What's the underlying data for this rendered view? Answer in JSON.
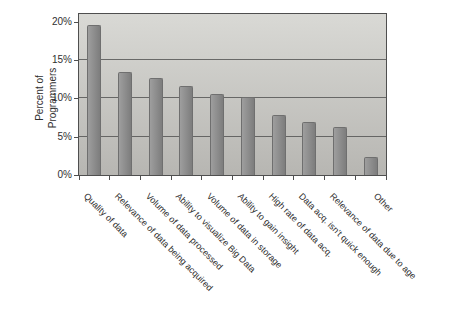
{
  "chart_data": {
    "type": "bar",
    "title": "",
    "ylabel_lines": [
      "Percent of",
      "Programmers"
    ],
    "categories": [
      "Quality of data",
      "Relevance of data being acquired",
      "Volume of data processed",
      "Ability to visualize Big Data",
      "Volume of data in storage",
      "Ability to gain insight",
      "High rate of data acq.",
      "Data acq. isn't quick enough",
      "Relevance of data due to age",
      "Other"
    ],
    "values": [
      19.6,
      13.5,
      12.7,
      11.6,
      10.6,
      10.2,
      7.8,
      6.9,
      6.2,
      2.4
    ],
    "y_ticks": [
      {
        "value": 0,
        "label": "0%"
      },
      {
        "value": 5,
        "label": "5%"
      },
      {
        "value": 10,
        "label": "10%"
      },
      {
        "value": 15,
        "label": "15%"
      },
      {
        "value": 20,
        "label": "20%"
      }
    ],
    "ylim": [
      0,
      21
    ],
    "gridline_values": [
      5,
      10,
      15
    ],
    "grid": "on",
    "legend": "none",
    "colors": {
      "page_bg": "#ffffff",
      "text": "#2f2f2f",
      "frame": "#4f4f4f",
      "gridline": "#4f4f4f",
      "plot_bg_top": "#d9d9d5",
      "plot_bg_bottom": "#b7b6b2",
      "bar": "#8c8c8c",
      "bar_light": "#9e9e9e",
      "bar_dark": "#7d7d7d",
      "bar_border": "#6f6f6f"
    }
  }
}
